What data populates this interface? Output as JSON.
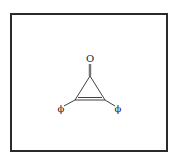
{
  "diagram": {
    "type": "chemical-structure",
    "molecule": "diphenylcyclopropenone",
    "atoms": {
      "oxygen_label": "O",
      "left_substituent_label": "ϕ",
      "right_substituent_label": "ϕ"
    },
    "bonds": [
      {
        "from": "O",
        "to": "C1",
        "order": 2
      },
      {
        "from": "C1",
        "to": "C2",
        "order": 1
      },
      {
        "from": "C1",
        "to": "C3",
        "order": 1
      },
      {
        "from": "C2",
        "to": "C3",
        "order": 2
      },
      {
        "from": "C2",
        "to": "phi_left",
        "order": 1
      },
      {
        "from": "C3",
        "to": "phi_right",
        "order": 1
      }
    ],
    "colors": {
      "line": "#2a2a2a",
      "background": "#ffffff"
    }
  }
}
